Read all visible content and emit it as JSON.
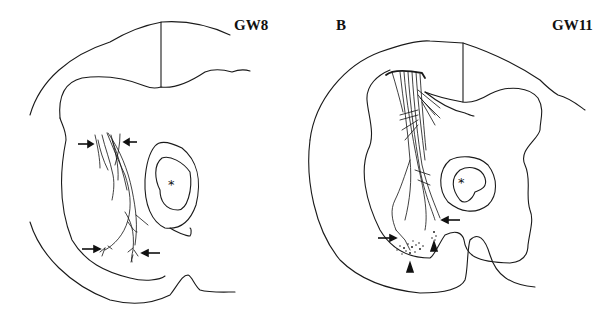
{
  "figure": {
    "panels": [
      {
        "id": "A",
        "panel_letter": "",
        "stage_label": "GW8",
        "center_marker": "*",
        "arrows": 4,
        "arrowheads": 0
      },
      {
        "id": "B",
        "panel_letter": "B",
        "stage_label": "GW11",
        "center_marker": "*",
        "arrows": 2,
        "arrowheads": 2
      }
    ]
  }
}
